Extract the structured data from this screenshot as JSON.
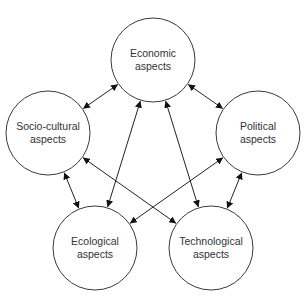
{
  "diagram": {
    "type": "network",
    "colors": {
      "stroke": "#3a3a3a",
      "text": "#333333",
      "background": "#ffffff"
    },
    "nodes": [
      {
        "id": "economic",
        "line1": "Economic",
        "line2": "aspects",
        "cx": 153,
        "cy": 60,
        "r": 42
      },
      {
        "id": "socio-cultural",
        "line1": "Socio-cultural",
        "line2": "aspects",
        "cx": 48,
        "cy": 133,
        "r": 42
      },
      {
        "id": "political",
        "line1": "Political",
        "line2": "aspects",
        "cx": 258,
        "cy": 133,
        "r": 42
      },
      {
        "id": "ecological",
        "line1": "Ecological",
        "line2": "aspects",
        "cx": 95,
        "cy": 248,
        "r": 42
      },
      {
        "id": "technological",
        "line1": "Technological",
        "line2": "aspects",
        "cx": 211,
        "cy": 248,
        "r": 42
      }
    ],
    "edges": [
      {
        "from": "economic",
        "to": "socio-cultural",
        "direction": "both"
      },
      {
        "from": "economic",
        "to": "political",
        "direction": "both"
      },
      {
        "from": "economic",
        "to": "ecological",
        "direction": "both"
      },
      {
        "from": "economic",
        "to": "technological",
        "direction": "both"
      },
      {
        "from": "socio-cultural",
        "to": "ecological",
        "direction": "both"
      },
      {
        "from": "socio-cultural",
        "to": "technological",
        "direction": "both"
      },
      {
        "from": "political",
        "to": "ecological",
        "direction": "both"
      },
      {
        "from": "political",
        "to": "technological",
        "direction": "both"
      }
    ]
  }
}
